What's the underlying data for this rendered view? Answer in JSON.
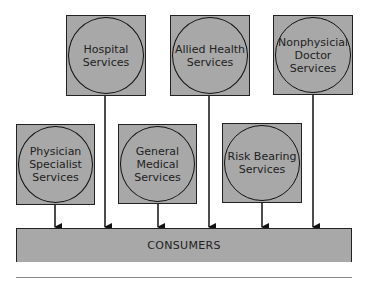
{
  "diagram": {
    "top_row": [
      {
        "label": "Hospital\nServices"
      },
      {
        "label": "Allied Health\nServices"
      },
      {
        "label": "Nonphysicial\nDoctor\nServices"
      }
    ],
    "bottom_row": [
      {
        "label": "Physician\nSpecialist\nServices"
      },
      {
        "label": "General\nMedical\nServices"
      },
      {
        "label": "Risk Bearing\nServices"
      }
    ],
    "target": {
      "label": "CONSUMERS"
    },
    "colors": {
      "fill": "#a8a8a8",
      "stroke": "#111111"
    }
  }
}
